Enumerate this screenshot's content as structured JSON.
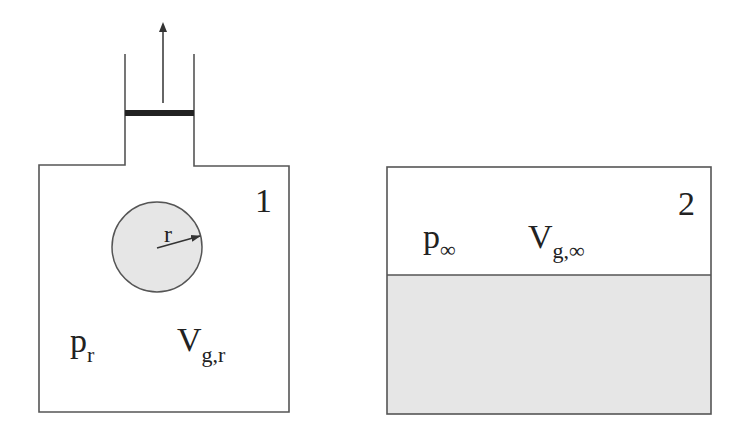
{
  "colors": {
    "stroke": "#444444",
    "piston": "#222222",
    "fill": "#e6e6e6",
    "text": "#222222"
  },
  "container1": {
    "number_label": "1",
    "pressure_label": "p",
    "pressure_subscript": "r",
    "volume_label": "V",
    "volume_subscript": "g,r",
    "bubble": {
      "radius_label": "r"
    },
    "piston": {
      "direction": "up-arrow"
    }
  },
  "container2": {
    "number_label": "2",
    "pressure_label": "p",
    "pressure_subscript": "∞",
    "volume_label": "V",
    "volume_subscript": "g,∞"
  }
}
